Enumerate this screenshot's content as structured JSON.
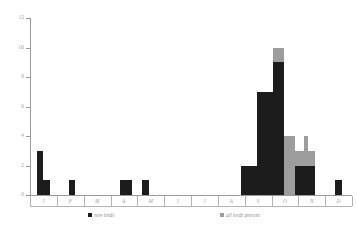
{
  "chart_data": {
    "type": "bar",
    "title": "",
    "subtitle": "",
    "xlabel": "",
    "ylabel": "",
    "ylim": [
      0,
      12
    ],
    "ytick_values": [
      0,
      2,
      4,
      6,
      8,
      10,
      12
    ],
    "ytick_labels": [
      "0",
      "2",
      "4",
      "6",
      "8",
      "10",
      "12"
    ],
    "grid": false,
    "legend_position": "bottom",
    "categories": [
      "J",
      "F",
      "M",
      "A",
      "M",
      "J",
      "J",
      "A",
      "S",
      "O",
      "N",
      "D"
    ],
    "category_names": [
      "January",
      "February",
      "March",
      "April",
      "May",
      "June",
      "July",
      "August",
      "September",
      "October",
      "November",
      "December"
    ],
    "series": [
      {
        "name": "new lords",
        "color": "#1c1c1c",
        "values": [
          3,
          1,
          0,
          1,
          1,
          0,
          0,
          0,
          2,
          9,
          2,
          1
        ]
      },
      {
        "name": "all lords present",
        "color": "#9d9d9d",
        "values": [
          0,
          0,
          0,
          0,
          0,
          0,
          0,
          0,
          0,
          10,
          4,
          0
        ]
      }
    ],
    "bars": [
      {
        "month": "J",
        "series": "new lords",
        "x": 7,
        "width": 6,
        "value": 3
      },
      {
        "month": "J",
        "series": "new lords",
        "x": 13,
        "width": 7,
        "value": 1
      },
      {
        "month": "F",
        "series": "new lords",
        "x": 39,
        "width": 6,
        "value": 1
      },
      {
        "month": "A",
        "series": "new lords",
        "x": 90,
        "width": 12,
        "value": 1
      },
      {
        "month": "M",
        "series": "new lords",
        "x": 112,
        "width": 7,
        "value": 1
      },
      {
        "month": "S",
        "series": "new lords",
        "x": 211,
        "width": 16,
        "value": 2
      },
      {
        "month": "O",
        "series": "new lords",
        "x": 227,
        "width": 16,
        "value": 7
      },
      {
        "month": "O",
        "series": "new lords",
        "x": 243,
        "width": 11,
        "value": 9
      },
      {
        "month": "O",
        "series": "all lords present",
        "x": 243,
        "width": 11,
        "value": 10
      },
      {
        "month": "O",
        "series": "all lords present",
        "x": 254,
        "width": 11,
        "value": 4
      },
      {
        "month": "N",
        "series": "all lords present",
        "x": 265,
        "width": 20,
        "value": 3
      },
      {
        "month": "N",
        "series": "new lords",
        "x": 265,
        "width": 20,
        "value": 2
      },
      {
        "month": "N",
        "series": "all lords present",
        "x": 274,
        "width": 4,
        "value": 4
      },
      {
        "month": "D",
        "series": "new lords",
        "x": 305,
        "width": 7,
        "value": 1
      }
    ]
  },
  "legend": {
    "items": [
      {
        "label": "new lords",
        "color": "#1c1c1c"
      },
      {
        "label": "all lords present",
        "color": "#9d9d9d"
      }
    ]
  },
  "axes": {
    "y": {
      "labels": [
        "12",
        "10",
        "8",
        "6",
        "4",
        "2",
        "0"
      ]
    },
    "x": {
      "labels": [
        "J",
        "F",
        "M",
        "A",
        "M",
        "J",
        "J",
        "A",
        "S",
        "O",
        "N",
        "D"
      ]
    }
  }
}
